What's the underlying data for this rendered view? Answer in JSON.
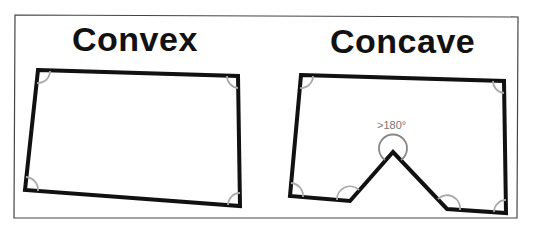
{
  "diagram": {
    "convex": {
      "label": "Convex",
      "vertices": [
        [
          38,
          70
        ],
        [
          238,
          76
        ],
        [
          240,
          206
        ],
        [
          25,
          190
        ]
      ]
    },
    "concave": {
      "label": "Concave",
      "vertices": [
        [
          301,
          75
        ],
        [
          504,
          81
        ],
        [
          506,
          213
        ],
        [
          447,
          209
        ],
        [
          393,
          152
        ],
        [
          350,
          201
        ],
        [
          290,
          196
        ]
      ],
      "reflex_angle_label": ">180°"
    },
    "colors": {
      "outline": "#111111",
      "angle_arc": "#aaaaaa",
      "frame": "#444444",
      "label_gray": "#777777"
    }
  }
}
